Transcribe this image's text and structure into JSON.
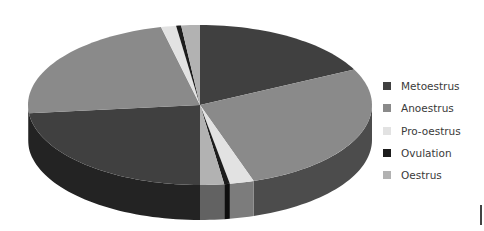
{
  "chart_data": {
    "type": "pie",
    "style": "3d",
    "title": "",
    "legend_position": "right",
    "legend": [
      "Metoestrus",
      "Anoestrus",
      "Pro-oestrus",
      "Ovulation",
      "Oestrus"
    ],
    "colors": {
      "Metoestrus": "#404040",
      "Anoestrus": "#8a8a8a",
      "Pro-oestrus": "#e2e2e2",
      "Ovulation": "#1c1c1c",
      "Oestrus": "#b2b2b2"
    },
    "slices": [
      {
        "label": "Metoestrus",
        "start_deg": 0,
        "end_deg": 63.7
      },
      {
        "label": "Anoestrus",
        "start_deg": 63.7,
        "end_deg": 161.8
      },
      {
        "label": "Pro-oestrus",
        "start_deg": 161.8,
        "end_deg": 170
      },
      {
        "label": "Ovulation",
        "start_deg": 170,
        "end_deg": 171.9
      },
      {
        "label": "Oestrus",
        "start_deg": 171.9,
        "end_deg": 180
      },
      {
        "label": "Metoestrus",
        "start_deg": 180,
        "end_deg": 264
      },
      {
        "label": "Anoestrus",
        "start_deg": 264,
        "end_deg": 346.9
      },
      {
        "label": "Pro-oestrus",
        "start_deg": 346.9,
        "end_deg": 352
      },
      {
        "label": "Ovulation",
        "start_deg": 352,
        "end_deg": 353.7
      },
      {
        "label": "Oestrus",
        "start_deg": 353.7,
        "end_deg": 360
      }
    ],
    "values_percent": {
      "Metoestrus": [
        17.7,
        23.3
      ],
      "Anoestrus": [
        27.3,
        23.0
      ],
      "Pro-oestrus": [
        2.3,
        1.4
      ],
      "Ovulation": [
        0.5,
        0.5
      ],
      "Oestrus": [
        2.3,
        1.7
      ]
    }
  },
  "legend": {
    "items": [
      {
        "label": "Metoestrus",
        "color": "#404040"
      },
      {
        "label": "Anoestrus",
        "color": "#8a8a8a"
      },
      {
        "label": "Pro-oestrus",
        "color": "#e2e2e2"
      },
      {
        "label": "Ovulation",
        "color": "#1c1c1c"
      },
      {
        "label": "Oestrus",
        "color": "#b2b2b2"
      }
    ]
  }
}
